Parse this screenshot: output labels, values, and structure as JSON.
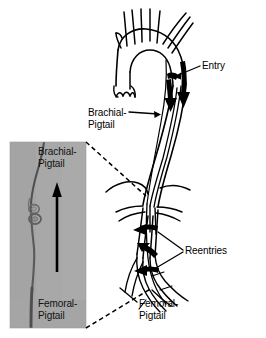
{
  "figure": {
    "type": "medical-line-drawing-with-photo-inset",
    "background_color": "#ffffff",
    "ink_color": "#000000"
  },
  "labels": {
    "entry": "Entry",
    "brachial_pigtail_line1": "Brachial-",
    "brachial_pigtail_line2": "Pigtail",
    "reentries": "Reentries",
    "femoral_pigtail_line1": "Femoral-",
    "femoral_pigtail_line2": "Pigtail"
  },
  "inset": {
    "kind": "fluoroscopic-photo",
    "background_color": "#a8a8a8",
    "top_label_line1": "Brachial-",
    "top_label_line2": "Pigtail",
    "bottom_label_line1": "Femoral-",
    "bottom_label_line2": "Pigtail",
    "arrow_direction": "up",
    "arrow_color": "#000000",
    "catheter_color": "#555555",
    "knot_description": "snare-loop"
  },
  "anatomy": {
    "structures": [
      "aortic-arch",
      "supra-aortic-branch-vessels",
      "aortic-valve-cusps",
      "descending-thoracic-aorta",
      "dissection-flap",
      "diaphragm-contour",
      "visceral-renal-branches",
      "abdominal-aorta",
      "iliac-bifurcation"
    ],
    "flow_arrows": {
      "entry_arrows": 2,
      "reentry_arrows": 3,
      "color": "#000000"
    }
  },
  "connectors": {
    "dashed_upper": "inset-top-right to descending-aorta",
    "dashed_lower": "inset-bottom-right to iliac-region",
    "dash_color": "#000000"
  }
}
